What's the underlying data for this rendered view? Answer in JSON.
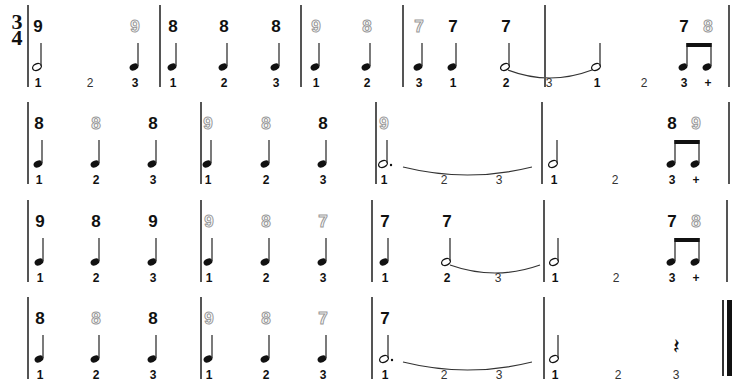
{
  "time_signature": {
    "top": "3",
    "bottom": "4"
  },
  "systems": [
    {
      "y": 0,
      "barlines": [
        27,
        159,
        300,
        402,
        544,
        728
      ],
      "events": [
        {
          "x": 38,
          "num": "9",
          "outline": false,
          "note": "half",
          "count": "1"
        },
        {
          "x": 90,
          "num": null,
          "note": null,
          "count": "2",
          "light": true
        },
        {
          "x": 135,
          "num": "9",
          "outline": true,
          "note": "quarter",
          "count": "3"
        },
        {
          "x": 173,
          "num": "8",
          "outline": false,
          "note": "quarter",
          "count": "1"
        },
        {
          "x": 224,
          "num": "8",
          "outline": false,
          "note": "quarter",
          "count": "2"
        },
        {
          "x": 276,
          "num": "8",
          "outline": false,
          "note": "quarter",
          "count": "3"
        },
        {
          "x": 316,
          "num": "9",
          "outline": true,
          "note": "quarter",
          "count": "1"
        },
        {
          "x": 367,
          "num": "8",
          "outline": true,
          "note": "quarter",
          "count": "2"
        },
        {
          "x": 419,
          "num": "7",
          "outline": true,
          "note": "quarter",
          "count": "3"
        },
        {
          "x": 453,
          "num": "7",
          "outline": false,
          "note": "quarter",
          "count": "1"
        },
        {
          "x": 506,
          "num": "7",
          "outline": false,
          "note": "half",
          "count": "2"
        },
        {
          "x": 549,
          "num": null,
          "note": null,
          "count": "3",
          "light": true
        },
        {
          "x": 597,
          "num": null,
          "note": "half",
          "count": "1"
        },
        {
          "x": 644,
          "num": null,
          "note": null,
          "count": "2",
          "light": true
        },
        {
          "x": 684,
          "num": "7",
          "outline": false,
          "note": "eighth-l",
          "count": "3"
        },
        {
          "x": 708,
          "num": "8",
          "outline": true,
          "note": "eighth-r",
          "count": "+"
        }
      ],
      "ties": [
        [
          508,
          592
        ]
      ]
    },
    {
      "y": 97,
      "barlines": [
        27,
        200,
        375,
        541,
        728
      ],
      "events": [
        {
          "x": 39,
          "num": "8",
          "outline": false,
          "note": "quarter",
          "count": "1"
        },
        {
          "x": 96,
          "num": "8",
          "outline": true,
          "note": "quarter",
          "count": "2"
        },
        {
          "x": 153,
          "num": "8",
          "outline": false,
          "note": "quarter",
          "count": "3"
        },
        {
          "x": 208,
          "num": "9",
          "outline": true,
          "note": "quarter",
          "count": "1"
        },
        {
          "x": 266,
          "num": "8",
          "outline": true,
          "note": "quarter",
          "count": "2"
        },
        {
          "x": 323,
          "num": "8",
          "outline": false,
          "note": "quarter",
          "count": "3"
        },
        {
          "x": 384,
          "num": "9",
          "outline": true,
          "note": "dotted-half",
          "count": "1"
        },
        {
          "x": 444,
          "num": null,
          "note": null,
          "count": "2",
          "light": true
        },
        {
          "x": 499,
          "num": null,
          "note": null,
          "count": "3",
          "light": true
        },
        {
          "x": 554,
          "num": null,
          "note": "half",
          "count": "1"
        },
        {
          "x": 615,
          "num": null,
          "note": null,
          "count": "2",
          "light": true
        },
        {
          "x": 672,
          "num": "8",
          "outline": false,
          "note": "eighth-l",
          "count": "3"
        },
        {
          "x": 696,
          "num": "9",
          "outline": true,
          "note": "eighth-r",
          "count": "+"
        }
      ],
      "ties": [
        [
          403,
          532
        ]
      ]
    },
    {
      "y": 195,
      "barlines": [
        27,
        200,
        371,
        543,
        726
      ],
      "events": [
        {
          "x": 40,
          "num": "9",
          "outline": false,
          "note": "quarter",
          "count": "1"
        },
        {
          "x": 96,
          "num": "8",
          "outline": false,
          "note": "quarter",
          "count": "2"
        },
        {
          "x": 153,
          "num": "9",
          "outline": false,
          "note": "quarter",
          "count": "3"
        },
        {
          "x": 209,
          "num": "9",
          "outline": true,
          "note": "quarter",
          "count": "1"
        },
        {
          "x": 266,
          "num": "8",
          "outline": true,
          "note": "quarter",
          "count": "2"
        },
        {
          "x": 323,
          "num": "7",
          "outline": true,
          "note": "quarter",
          "count": "3"
        },
        {
          "x": 385,
          "num": "7",
          "outline": false,
          "note": "quarter",
          "count": "1"
        },
        {
          "x": 447,
          "num": "7",
          "outline": false,
          "note": "half",
          "count": "2"
        },
        {
          "x": 498,
          "num": null,
          "note": null,
          "count": "3",
          "light": true
        },
        {
          "x": 555,
          "num": null,
          "note": "half",
          "count": "1"
        },
        {
          "x": 616,
          "num": null,
          "note": null,
          "count": "2",
          "light": true
        },
        {
          "x": 672,
          "num": "7",
          "outline": false,
          "note": "eighth-l",
          "count": "3"
        },
        {
          "x": 696,
          "num": "8",
          "outline": true,
          "note": "eighth-r",
          "count": "+"
        }
      ],
      "ties": [
        [
          450,
          540
        ]
      ]
    },
    {
      "y": 292,
      "barlines": [
        27,
        200,
        371,
        543
      ],
      "final_barline": {
        "thin_x": 722,
        "thick_x": 727
      },
      "events": [
        {
          "x": 40,
          "num": "8",
          "outline": false,
          "note": "quarter",
          "count": "1"
        },
        {
          "x": 96,
          "num": "8",
          "outline": true,
          "note": "quarter",
          "count": "2"
        },
        {
          "x": 153,
          "num": "8",
          "outline": false,
          "note": "quarter",
          "count": "3"
        },
        {
          "x": 209,
          "num": "9",
          "outline": true,
          "note": "quarter",
          "count": "1"
        },
        {
          "x": 266,
          "num": "8",
          "outline": true,
          "note": "quarter",
          "count": "2"
        },
        {
          "x": 323,
          "num": "7",
          "outline": true,
          "note": "quarter",
          "count": "3"
        },
        {
          "x": 385,
          "num": "7",
          "outline": false,
          "note": "dotted-half",
          "count": "1"
        },
        {
          "x": 444,
          "num": null,
          "note": null,
          "count": "2",
          "light": true
        },
        {
          "x": 499,
          "num": null,
          "note": null,
          "count": "3",
          "light": true
        },
        {
          "x": 555,
          "num": null,
          "note": "half",
          "count": "1"
        },
        {
          "x": 618,
          "num": null,
          "note": null,
          "count": "2",
          "light": true
        },
        {
          "x": 676,
          "num": null,
          "note": "quarter-rest",
          "count": "3",
          "light": true
        }
      ],
      "ties": [
        [
          403,
          532
        ]
      ]
    }
  ]
}
